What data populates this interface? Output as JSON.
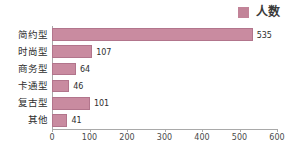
{
  "legend": {
    "position": "top-right",
    "entries": [
      {
        "label": "人数",
        "color": "#c28398",
        "swatch_name": "legend-swatch-renshu"
      }
    ]
  },
  "axis": {
    "x_ticks": [
      "0",
      "100",
      "200",
      "300",
      "400",
      "500",
      "600"
    ],
    "xlabel": "",
    "ylabel": ""
  },
  "chart_data": {
    "type": "bar",
    "orientation": "horizontal",
    "title": "",
    "subtitle": "",
    "xlabel": "",
    "ylabel": "",
    "categories": [
      "简约型",
      "时尚型",
      "商务型",
      "卡通型",
      "复古型",
      "其他"
    ],
    "values": [
      535,
      107,
      64,
      46,
      101,
      41
    ],
    "series": [
      {
        "name": "人数",
        "color": "#c98ba0",
        "values": [
          535,
          107,
          64,
          46,
          101,
          41
        ]
      }
    ],
    "xlim": [
      0,
      600
    ],
    "xticks": [
      0,
      100,
      200,
      300,
      400,
      500,
      600
    ],
    "grid": false,
    "legend_position": "top-right",
    "data_labels": [
      "535",
      "107",
      "64",
      "46",
      "101",
      "41"
    ],
    "bar_color": "#c98ba0",
    "bar_border_color": "#b2758c",
    "axis_color": "#a9a9a9",
    "background": "#ffffff"
  }
}
